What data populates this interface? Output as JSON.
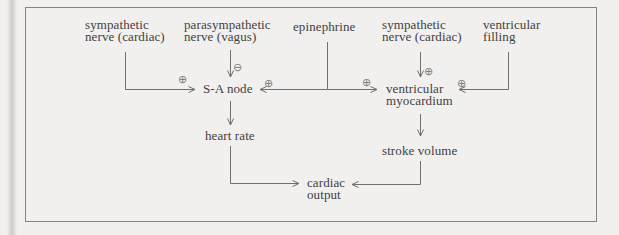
{
  "palette": {
    "background": "#f1f0ee",
    "border": "#858583",
    "line": "#6f6f6f",
    "text": "#414141",
    "sign": "#7d7d7d"
  },
  "signs": {
    "plus": "⊕",
    "minus": "⊖"
  },
  "nodes": {
    "sym1": {
      "lines": [
        "sympathetic",
        "nerve (cardiac)"
      ]
    },
    "para": {
      "lines": [
        "parasympathetic",
        "nerve (vagus)"
      ]
    },
    "epi": {
      "lines": [
        "epinephrine"
      ]
    },
    "sym2": {
      "lines": [
        "sympathetic",
        "nerve (cardiac)"
      ]
    },
    "fill": {
      "lines": [
        "ventricular",
        "filling"
      ]
    },
    "sa": {
      "lines": [
        "S-A node"
      ]
    },
    "vm": {
      "lines": [
        "ventricular",
        "myocardium"
      ]
    },
    "hr": {
      "lines": [
        "heart rate"
      ]
    },
    "sv": {
      "lines": [
        "stroke volume"
      ]
    },
    "co": {
      "lines": [
        "cardiac",
        "output"
      ]
    }
  },
  "edges": [
    {
      "from": "sympathetic nerve (cardiac)",
      "to": "S-A node",
      "sign": "⊕"
    },
    {
      "from": "parasympathetic nerve (vagus)",
      "to": "S-A node",
      "sign": "⊖"
    },
    {
      "from": "epinephrine",
      "to": "S-A node",
      "sign": "⊕"
    },
    {
      "from": "epinephrine",
      "to": "ventricular myocardium",
      "sign": "⊕"
    },
    {
      "from": "sympathetic nerve (cardiac)",
      "to": "ventricular myocardium",
      "sign": "⊕"
    },
    {
      "from": "ventricular filling",
      "to": "ventricular myocardium",
      "sign": "⊕"
    },
    {
      "from": "S-A node",
      "to": "heart rate",
      "sign": null
    },
    {
      "from": "ventricular myocardium",
      "to": "stroke volume",
      "sign": null
    },
    {
      "from": "heart rate",
      "to": "cardiac output",
      "sign": null
    },
    {
      "from": "stroke volume",
      "to": "cardiac output",
      "sign": null
    }
  ]
}
